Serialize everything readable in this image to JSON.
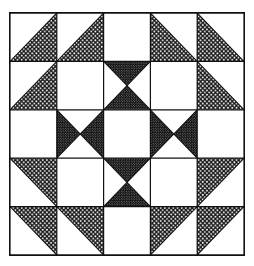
{
  "figure": {
    "title": "Pieced quilt block pattern",
    "grid_rows": 5,
    "grid_cols": 5,
    "frame_color": "#111111",
    "background_color": "#ffffff",
    "fill_light_label": "open-dot-stipple",
    "fill_dark_label": "dense-dot-stipple",
    "fill_plain_label": "plain-white"
  },
  "legend": {
    "plain": "white",
    "light": "light dotted",
    "dark": "dark dotted"
  },
  "cells": [
    [
      {
        "id": "r1c1",
        "type": "hst",
        "fill": "light",
        "orient": "br",
        "name": "cell-r1c1-half-square-triangle"
      },
      {
        "id": "r1c2",
        "type": "hst",
        "fill": "light",
        "orient": "br",
        "name": "cell-r1c2-half-square-triangle"
      },
      {
        "id": "r1c3",
        "type": "plain",
        "fill": "plain",
        "orient": "none",
        "name": "cell-r1c3-plain-square"
      },
      {
        "id": "r1c4",
        "type": "hst",
        "fill": "light",
        "orient": "bl",
        "name": "cell-r1c4-half-square-triangle"
      },
      {
        "id": "r1c5",
        "type": "hst",
        "fill": "light",
        "orient": "bl",
        "name": "cell-r1c5-half-square-triangle"
      }
    ],
    [
      {
        "id": "r2c1",
        "type": "hst",
        "fill": "light",
        "orient": "br",
        "name": "cell-r2c1-half-square-triangle"
      },
      {
        "id": "r2c2",
        "type": "plain",
        "fill": "plain",
        "orient": "none",
        "name": "cell-r2c2-plain-square"
      },
      {
        "id": "r2c3",
        "type": "hourglass-v",
        "fill": "dark",
        "orient": "v",
        "name": "cell-r2c3-hourglass-unit"
      },
      {
        "id": "r2c4",
        "type": "plain",
        "fill": "plain",
        "orient": "none",
        "name": "cell-r2c4-plain-square"
      },
      {
        "id": "r2c5",
        "type": "hst",
        "fill": "light",
        "orient": "bl",
        "name": "cell-r2c5-half-square-triangle"
      }
    ],
    [
      {
        "id": "r3c1",
        "type": "plain",
        "fill": "plain",
        "orient": "none",
        "name": "cell-r3c1-plain-square"
      },
      {
        "id": "r3c2",
        "type": "hourglass-h",
        "fill": "dark",
        "orient": "h",
        "name": "cell-r3c2-hourglass-unit"
      },
      {
        "id": "r3c3",
        "type": "plain",
        "fill": "plain",
        "orient": "none",
        "name": "cell-r3c3-plain-square"
      },
      {
        "id": "r3c4",
        "type": "hourglass-h",
        "fill": "dark",
        "orient": "h",
        "name": "cell-r3c4-hourglass-unit"
      },
      {
        "id": "r3c5",
        "type": "plain",
        "fill": "plain",
        "orient": "none",
        "name": "cell-r3c5-plain-square"
      }
    ],
    [
      {
        "id": "r4c1",
        "type": "hst",
        "fill": "light",
        "orient": "tr",
        "name": "cell-r4c1-half-square-triangle"
      },
      {
        "id": "r4c2",
        "type": "plain",
        "fill": "plain",
        "orient": "none",
        "name": "cell-r4c2-plain-square"
      },
      {
        "id": "r4c3",
        "type": "hourglass-v",
        "fill": "dark",
        "orient": "v",
        "name": "cell-r4c3-hourglass-unit"
      },
      {
        "id": "r4c4",
        "type": "plain",
        "fill": "plain",
        "orient": "none",
        "name": "cell-r4c4-plain-square"
      },
      {
        "id": "r4c5",
        "type": "hst",
        "fill": "light",
        "orient": "tl",
        "name": "cell-r4c5-half-square-triangle"
      }
    ],
    [
      {
        "id": "r5c1",
        "type": "hst",
        "fill": "light",
        "orient": "tr",
        "name": "cell-r5c1-half-square-triangle"
      },
      {
        "id": "r5c2",
        "type": "hst",
        "fill": "light",
        "orient": "tr",
        "name": "cell-r5c2-half-square-triangle"
      },
      {
        "id": "r5c3",
        "type": "plain",
        "fill": "plain",
        "orient": "none",
        "name": "cell-r5c3-plain-square"
      },
      {
        "id": "r5c4",
        "type": "hst",
        "fill": "light",
        "orient": "tl",
        "name": "cell-r5c4-half-square-triangle"
      },
      {
        "id": "r5c5",
        "type": "hst",
        "fill": "light",
        "orient": "tl",
        "name": "cell-r5c5-half-square-triangle"
      }
    ]
  ]
}
